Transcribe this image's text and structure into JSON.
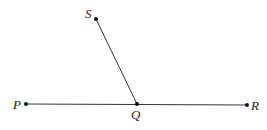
{
  "diagram": {
    "type": "geometry-figure",
    "colors": {
      "line": "#333333",
      "point": "#111111",
      "label": "#222222",
      "background": "#ffffff"
    },
    "points": [
      {
        "id": "S",
        "label": "S",
        "x": 96,
        "y": 19
      },
      {
        "id": "P",
        "label": "P",
        "x": 26,
        "y": 104
      },
      {
        "id": "Q",
        "label": "Q",
        "x": 137,
        "y": 104
      },
      {
        "id": "R",
        "label": "R",
        "x": 247,
        "y": 105
      }
    ],
    "segments": [
      {
        "from": "P",
        "to": "R"
      },
      {
        "from": "Q",
        "to": "S"
      }
    ],
    "labels": {
      "S": "S",
      "P": "P",
      "Q": "Q",
      "R": "R"
    }
  }
}
